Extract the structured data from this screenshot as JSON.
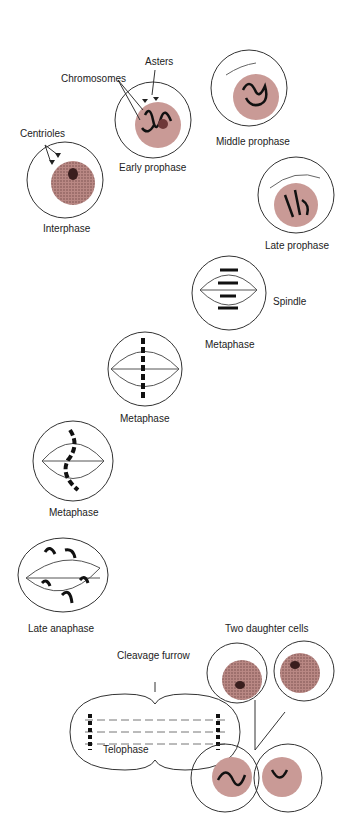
{
  "colors": {
    "nucleus": "#c99a96",
    "nucleus_dark": "#7a4a4a",
    "outline": "#333333",
    "chromosome": "#111111"
  },
  "labels": {
    "asters": "Asters",
    "chromosomes": "Chromosomes",
    "centrioles": "Centrioles",
    "early_prophase": "Early prophase",
    "middle_prophase": "Middle prophase",
    "interphase": "Interphase",
    "late_prophase": "Late prophase",
    "spindle": "Spindle",
    "metaphase_1": "Metaphase",
    "metaphase_2": "Metaphase",
    "metaphase_3": "Metaphase",
    "late_anaphase": "Late anaphase",
    "two_daughter_cells": "Two daughter cells",
    "cleavage_furrow": "Cleavage furrow",
    "telophase": "Telophase"
  }
}
